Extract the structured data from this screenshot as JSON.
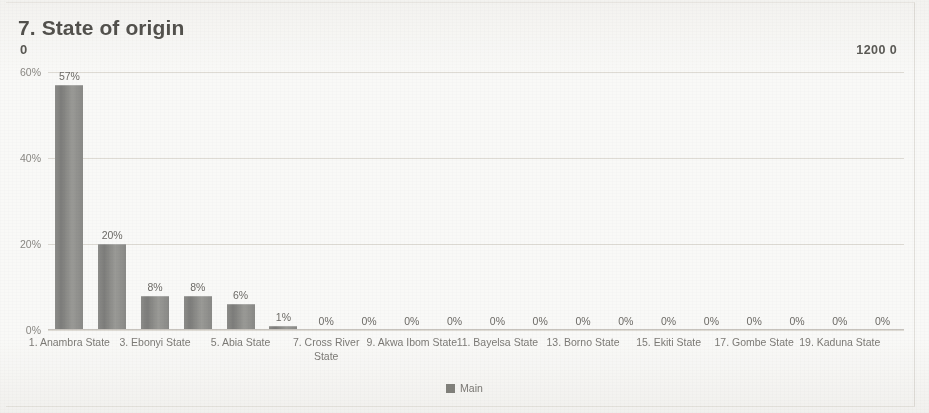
{
  "title": "7. State of origin",
  "title_sub": "0",
  "corner_value": "1200 0",
  "legend": {
    "label": "Main",
    "swatch_color": "#84847f"
  },
  "colors": {
    "bar": "#8a8a88",
    "gridline": "#ddd9d3",
    "text": "#7d7b77",
    "title": "#54534f",
    "background": "#fbfbfa"
  },
  "chart_data": {
    "type": "bar",
    "title": "7. State of origin",
    "xlabel": "",
    "ylabel": "",
    "ylim": [
      0,
      60
    ],
    "grid": true,
    "legend_position": "bottom",
    "ytick_labels": [
      "0%",
      "20%",
      "40%",
      "60%"
    ],
    "ytick_values": [
      0,
      20,
      40,
      60
    ],
    "categories": [
      "1. Anambra State",
      "2.",
      "3. Ebonyi State",
      "4.",
      "5. Abia State",
      "6.",
      "7. Cross River State",
      "8.",
      "9. Akwa Ibom State",
      "10.",
      "11. Bayelsa State",
      "12.",
      "13. Borno State",
      "14.",
      "15. Ekiti State",
      "16.",
      "17. Gombe State",
      "18.",
      "19. Kaduna State",
      "20."
    ],
    "xtick_labels_shown": [
      "1. Anambra State",
      "3. Ebonyi State",
      "5. Abia State",
      "7. Cross River State",
      "9. Akwa Ibom State",
      "11. Bayelsa State",
      "13. Borno State",
      "15. Ekiti State",
      "17. Gombe State",
      "19. Kaduna State"
    ],
    "series": [
      {
        "name": "Main",
        "values": [
          57,
          20,
          8,
          8,
          6,
          1,
          0,
          0,
          0,
          0,
          0,
          0,
          0,
          0,
          0,
          0,
          0,
          0,
          0,
          0
        ],
        "data_labels": [
          "57%",
          "20%",
          "8%",
          "8%",
          "6%",
          "1%",
          "0%",
          "0%",
          "0%",
          "0%",
          "0%",
          "0%",
          "0%",
          "0%",
          "0%",
          "0%",
          "0%",
          "0%",
          "0%",
          "0%"
        ]
      }
    ]
  }
}
